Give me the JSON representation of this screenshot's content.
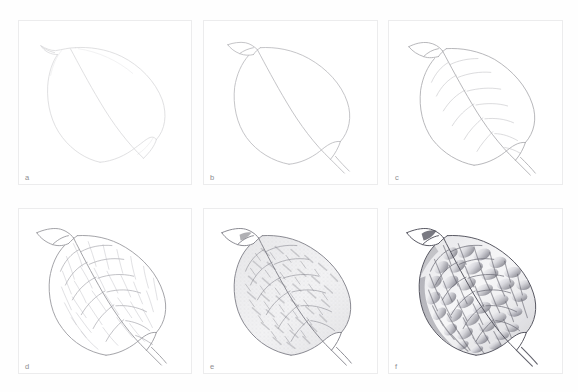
{
  "figure": {
    "background_color": "#ffffff",
    "panel_border_color": "#ececed",
    "label_color": "#8e8e90",
    "graphite_color": "#9a9a9e",
    "rows": 2,
    "columns": 3
  },
  "panels": [
    {
      "id": "panel-a",
      "label": "a",
      "stage": "light construction lines",
      "column": 1,
      "row": 1,
      "line_opacity": 0.18,
      "shading": "none"
    },
    {
      "id": "panel-b",
      "label": "b",
      "stage": "refined outline with folded tip",
      "column": 2,
      "row": 1,
      "line_opacity": 0.32,
      "shading": "none"
    },
    {
      "id": "panel-c",
      "label": "c",
      "stage": "midrib and primary veins added",
      "column": 3,
      "row": 1,
      "line_opacity": 0.38,
      "shading": "none"
    },
    {
      "id": "panel-d",
      "label": "d",
      "stage": "secondary vein network mapped as quilted cells",
      "column": 1,
      "row": 2,
      "line_opacity": 0.5,
      "shading": "none"
    },
    {
      "id": "panel-e",
      "label": "e",
      "stage": "first pass of tonal shading between veins",
      "column": 2,
      "row": 2,
      "line_opacity": 0.6,
      "shading": "light"
    },
    {
      "id": "panel-f",
      "label": "f",
      "stage": "finished rendering with deep contrast",
      "column": 3,
      "row": 2,
      "line_opacity": 0.85,
      "shading": "full"
    }
  ]
}
